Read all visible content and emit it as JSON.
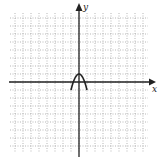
{
  "chart_data": {
    "type": "line",
    "title": "",
    "xlabel": "x",
    "ylabel": "y",
    "xlim": [
      -9,
      9
    ],
    "ylim": [
      -9,
      9
    ],
    "grid": true,
    "grid_style": "dotted",
    "tick_labels": false,
    "legend": null,
    "series": [
      {
        "name": "downward parabola",
        "equation": "y = 1 - 2x^2",
        "domain": [
          -1,
          1
        ],
        "x": [
          -1,
          -0.75,
          -0.5,
          -0.25,
          0,
          0.25,
          0.5,
          0.75,
          1
        ],
        "y": [
          -1,
          -0.125,
          0.5,
          0.875,
          1,
          0.875,
          0.5,
          -0.125,
          -1
        ],
        "color": "#222222"
      }
    ]
  },
  "axes": {
    "x_label": "x",
    "y_label": "y"
  },
  "colors": {
    "axis": "#222222",
    "grid": "#9a9a9a",
    "curve": "#222222"
  }
}
